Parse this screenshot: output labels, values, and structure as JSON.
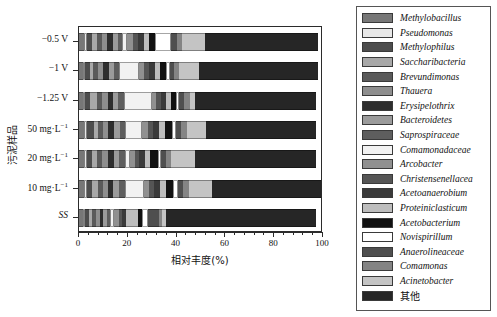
{
  "chart_data": {
    "type": "bar",
    "orientation": "horizontal",
    "stacked": true,
    "title": "",
    "xlabel": "相对丰度(%)",
    "ylabel": "污泥样品",
    "xlim": [
      0,
      100
    ],
    "xticks": [
      0,
      20,
      40,
      60,
      80,
      100
    ],
    "xticklabels": [
      "0",
      "20",
      "40",
      "60",
      "80",
      "100"
    ],
    "grid": false,
    "legend_position": "right-outside",
    "categories": [
      "-0.5 V",
      "-1 V",
      "-1.25 V",
      "50 mg·L⁻¹",
      "20 mg·L⁻¹",
      "10 mg·L⁻¹",
      "SS"
    ],
    "series": [
      {
        "name": "Methylobacillus",
        "color": "#777777",
        "values": [
          2.0,
          1.5,
          1.5,
          2.0,
          2.0,
          2.0,
          1.5
        ]
      },
      {
        "name": "Pseudomonas",
        "color": "#e8e8e8",
        "values": [
          1.5,
          1.0,
          1.0,
          1.5,
          1.5,
          1.5,
          1.0
        ]
      },
      {
        "name": "Methylophilus",
        "color": "#4d4d4d",
        "values": [
          2.0,
          2.0,
          2.0,
          2.5,
          2.0,
          2.0,
          1.5
        ]
      },
      {
        "name": "Saccharibacteria",
        "color": "#a8a8a8",
        "values": [
          2.0,
          1.5,
          3.0,
          2.0,
          2.0,
          2.5,
          1.5
        ]
      },
      {
        "name": "Brevundimonas",
        "color": "#5a5a5a",
        "values": [
          2.0,
          2.0,
          2.0,
          2.0,
          2.0,
          2.0,
          1.5
        ]
      },
      {
        "name": "Thauera",
        "color": "#8e8e8e",
        "values": [
          2.0,
          2.0,
          2.5,
          2.0,
          2.5,
          2.0,
          1.5
        ]
      },
      {
        "name": "Erysipelothrix",
        "color": "#2e2e2e",
        "values": [
          2.5,
          2.5,
          2.0,
          2.5,
          2.5,
          2.0,
          1.5
        ]
      },
      {
        "name": "Bacteroidetes",
        "color": "#9b9b9b",
        "values": [
          2.0,
          2.0,
          2.0,
          2.5,
          2.0,
          2.5,
          1.5
        ]
      },
      {
        "name": "Saprospiraceae",
        "color": "#5e5e5e",
        "values": [
          2.0,
          2.0,
          2.5,
          2.0,
          2.5,
          2.5,
          1.5
        ]
      },
      {
        "name": "Comamonadaceae",
        "color": "#f2f2f2",
        "values": [
          2.0,
          8.5,
          11.5,
          7.0,
          2.0,
          8.0,
          1.5
        ]
      },
      {
        "name": "Arcobacter",
        "color": "#909090",
        "values": [
          2.5,
          2.0,
          2.0,
          2.5,
          2.0,
          2.0,
          2.0
        ]
      },
      {
        "name": "Christensenellacea",
        "color": "#555555",
        "values": [
          2.0,
          2.0,
          2.0,
          2.0,
          2.0,
          2.0,
          1.5
        ]
      },
      {
        "name": "Acetoanaerobium",
        "color": "#3a3a3a",
        "values": [
          2.5,
          2.5,
          2.0,
          2.5,
          2.5,
          2.5,
          1.5
        ]
      },
      {
        "name": "Proteiniclasticum",
        "color": "#bdbdbd",
        "values": [
          2.0,
          2.0,
          2.0,
          2.5,
          2.0,
          2.5,
          5.0
        ]
      },
      {
        "name": "Acetobacterium",
        "color": "#111111",
        "values": [
          2.5,
          2.5,
          2.0,
          3.0,
          3.0,
          3.0,
          1.5
        ]
      },
      {
        "name": "Novispirillum",
        "color": "#ffffff",
        "values": [
          6.5,
          1.5,
          1.5,
          1.5,
          1.5,
          2.0,
          2.5
        ]
      },
      {
        "name": "Anaerolineaceae",
        "color": "#4f4f4f",
        "values": [
          2.5,
          2.0,
          2.0,
          2.0,
          2.0,
          2.0,
          4.5
        ]
      },
      {
        "name": "Comamonas",
        "color": "#848484",
        "values": [
          2.0,
          2.0,
          2.5,
          2.5,
          2.0,
          2.5,
          1.5
        ]
      },
      {
        "name": "Acinetobacter",
        "color": "#c4c4c4",
        "values": [
          9.5,
          8.0,
          2.0,
          8.0,
          10.0,
          9.5,
          1.5
        ]
      },
      {
        "name": "其他",
        "color": "#262626",
        "values": [
          47.0,
          49.5,
          50.0,
          45.5,
          50.0,
          45.0,
          62.0
        ]
      }
    ]
  },
  "axes": {
    "x_label": "相对丰度(%)",
    "y_label": "污泥样品",
    "x_tick_labels": [
      "0",
      "20",
      "40",
      "60",
      "80",
      "100"
    ],
    "y_tick_labels": [
      {
        "main": "−0.5 V",
        "sup": ""
      },
      {
        "main": "−1 V",
        "sup": ""
      },
      {
        "main": "−1.25 V",
        "sup": ""
      },
      {
        "main": "50 mg·L",
        "sup": "−1"
      },
      {
        "main": "20 mg·L",
        "sup": "−1"
      },
      {
        "main": "10 mg·L",
        "sup": "−1"
      },
      {
        "main": "SS",
        "sup": ""
      }
    ]
  },
  "legend": {
    "items": [
      {
        "label": "Methylobacillus",
        "color": "#777777",
        "cjk": false
      },
      {
        "label": "Pseudomonas",
        "color": "#e8e8e8",
        "cjk": false
      },
      {
        "label": "Methylophilus",
        "color": "#4d4d4d",
        "cjk": false
      },
      {
        "label": "Saccharibacteria",
        "color": "#a8a8a8",
        "cjk": false
      },
      {
        "label": "Brevundimonas",
        "color": "#5a5a5a",
        "cjk": false
      },
      {
        "label": "Thauera",
        "color": "#8e8e8e",
        "cjk": false
      },
      {
        "label": "Erysipelothrix",
        "color": "#2e2e2e",
        "cjk": false
      },
      {
        "label": "Bacteroidetes",
        "color": "#9b9b9b",
        "cjk": false
      },
      {
        "label": "Saprospiraceae",
        "color": "#5e5e5e",
        "cjk": false
      },
      {
        "label": "Comamonadaceae",
        "color": "#f2f2f2",
        "cjk": false
      },
      {
        "label": "Arcobacter",
        "color": "#909090",
        "cjk": false
      },
      {
        "label": "Christensenellacea",
        "color": "#555555",
        "cjk": false
      },
      {
        "label": "Acetoanaerobium",
        "color": "#3a3a3a",
        "cjk": false
      },
      {
        "label": "Proteiniclasticum",
        "color": "#bdbdbd",
        "cjk": false
      },
      {
        "label": "Acetobacterium",
        "color": "#111111",
        "cjk": false
      },
      {
        "label": "Novispirillum",
        "color": "#ffffff",
        "cjk": false
      },
      {
        "label": "Anaerolineaceae",
        "color": "#4f4f4f",
        "cjk": false
      },
      {
        "label": "Comamonas",
        "color": "#848484",
        "cjk": false
      },
      {
        "label": "Acinetobacter",
        "color": "#c4c4c4",
        "cjk": false
      },
      {
        "label": "其他",
        "color": "#262626",
        "cjk": true
      }
    ]
  }
}
